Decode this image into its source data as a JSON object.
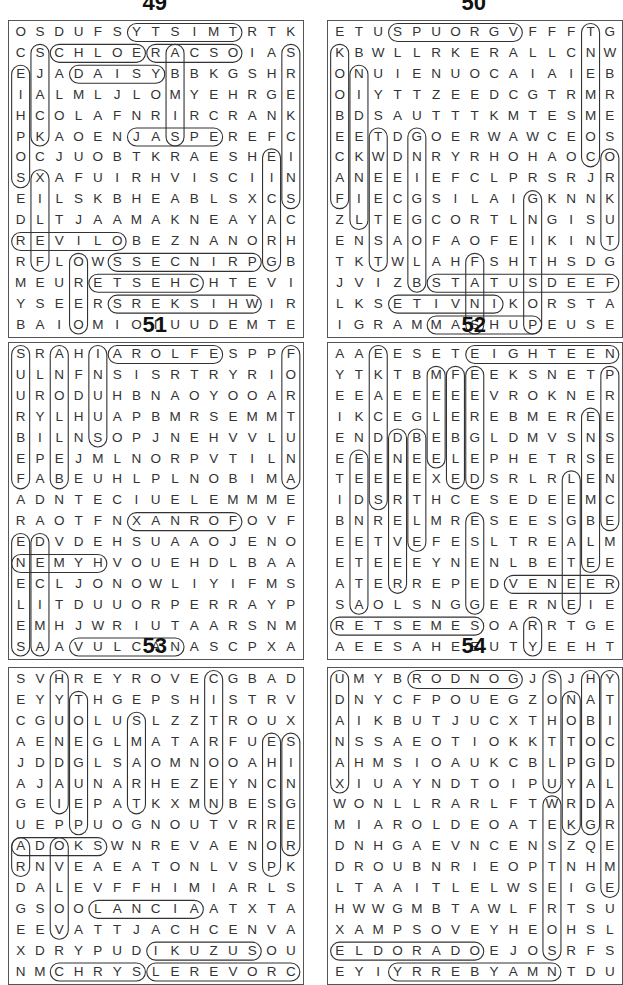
{
  "page": {
    "puzzles": [
      {
        "number": "49",
        "rows": [
          "OSDUFSYTSIMTRTK",
          "CSCHLOERACSOIAS",
          "EJADAISYBBKGSHR",
          "IALMLJLOMYEHRGE",
          "HCOLAFNRIRCRANK",
          "PKAOENJASPEREFC",
          "OCJUOBTKRAESHEI",
          "SXAFUIRHVISCIIN",
          "EILSKBHEABLSXCS",
          "DLTJAAMAKNEAYAC",
          "REVILOBEZNANORH",
          "RFLOWSSECNIRPGB",
          "MEURETSEHCHTEVI",
          "YSEERSREKSIHWIR",
          "BAIOMIOIUUDEMTE"
        ],
        "marked_words": [
          {
            "r1": 0,
            "c1": 6,
            "r2": 0,
            "c2": 11
          },
          {
            "r1": 1,
            "c1": 2,
            "r2": 1,
            "c2": 6
          },
          {
            "r1": 1,
            "c1": 7,
            "r2": 1,
            "c2": 11
          },
          {
            "r1": 2,
            "c1": 3,
            "r2": 2,
            "c2": 7
          },
          {
            "r1": 5,
            "c1": 6,
            "r2": 5,
            "c2": 10
          },
          {
            "r1": 10,
            "c1": 0,
            "r2": 10,
            "c2": 5
          },
          {
            "r1": 11,
            "c1": 5,
            "r2": 11,
            "c2": 12
          },
          {
            "r1": 12,
            "c1": 4,
            "r2": 12,
            "c2": 9
          },
          {
            "r1": 13,
            "c1": 5,
            "r2": 13,
            "c2": 12
          },
          {
            "r1": 1,
            "c1": 14,
            "r2": 8,
            "c2": 14
          },
          {
            "r1": 6,
            "c1": 13,
            "r2": 11,
            "c2": 13
          },
          {
            "r1": 1,
            "c1": 8,
            "r2": 5,
            "c2": 8
          },
          {
            "r1": 2,
            "c1": 0,
            "r2": 7,
            "c2": 0
          },
          {
            "r1": 1,
            "c1": 1,
            "r2": 5,
            "c2": 1
          },
          {
            "r1": 7,
            "c1": 1,
            "r2": 11,
            "c2": 1
          },
          {
            "r1": 11,
            "c1": 3,
            "r2": 14,
            "c2": 3
          }
        ]
      },
      {
        "number": "50",
        "rows": [
          "ETUSPUORGVFFFTG",
          "KBWLLRKERALLCNW",
          "ONUIENUOCAIAIEB",
          "OIYTTZEEDCGTRMR",
          "BDSAUTTTKMTESME",
          "EETDGOERWAWCEOS",
          "CKWDNRYRHOHAOCO",
          "ANEEIEFCLPRSRJR",
          "FIECGSILAIGKNNK",
          "ZLTEGCORTLNGISU",
          "ENSAOFAOFEIKINT",
          "TKTWLAHFSHTHSDG",
          "JVIZBSTATUSDEEF",
          "LKSETIVNIKORSTA",
          "IGRAMMASHUPEUSE"
        ],
        "marked_words": [
          {
            "r1": 0,
            "c1": 3,
            "r2": 0,
            "c2": 9
          },
          {
            "r1": 12,
            "c1": 5,
            "r2": 12,
            "c2": 14
          },
          {
            "r1": 13,
            "c1": 3,
            "r2": 13,
            "c2": 8
          },
          {
            "r1": 14,
            "c1": 5,
            "r2": 14,
            "c2": 10
          },
          {
            "r1": 1,
            "c1": 0,
            "r2": 8,
            "c2": 0
          },
          {
            "r1": 2,
            "c1": 1,
            "r2": 9,
            "c2": 1
          },
          {
            "r1": 0,
            "c1": 13,
            "r2": 6,
            "c2": 13
          },
          {
            "r1": 6,
            "c1": 14,
            "r2": 10,
            "c2": 14
          },
          {
            "r1": 5,
            "c1": 2,
            "r2": 11,
            "c2": 2
          },
          {
            "r1": 5,
            "c1": 4,
            "r2": 12,
            "c2": 4
          },
          {
            "r1": 8,
            "c1": 10,
            "r2": 14,
            "c2": 10
          },
          {
            "r1": 11,
            "c1": 7,
            "r2": 14,
            "c2": 7
          }
        ]
      },
      {
        "number": "51",
        "rows": [
          "SRAHIAROLFESPPF",
          "ULNFNSISRTRYRIO",
          "URODUHBNAOYOOAR",
          "RYLHUAPBMRSEMMT",
          "BILNSOPJNEHVVLU",
          "EPEJMLNORPVTILN",
          "FABEUHLPLNOBIMA",
          "ADNTECIUELEMMME",
          "RAOTFNXANROFOVF",
          "EDVDEHSUAAOJENO",
          "NEMYHVOUEHDLBAA",
          "ECLJONOWLIYIFMS",
          "LITDUUORPERRAYP",
          "EMHJWRIUTAARSNM",
          "SAAVULCANASCPXA"
        ],
        "marked_words": [
          {
            "r1": 0,
            "c1": 5,
            "r2": 0,
            "c2": 10
          },
          {
            "r1": 8,
            "c1": 6,
            "r2": 8,
            "c2": 11
          },
          {
            "r1": 10,
            "c1": 0,
            "r2": 10,
            "c2": 4
          },
          {
            "r1": 14,
            "c1": 3,
            "r2": 14,
            "c2": 8
          },
          {
            "r1": 0,
            "c1": 0,
            "r2": 6,
            "c2": 0
          },
          {
            "r1": 0,
            "c1": 2,
            "r2": 6,
            "c2": 2
          },
          {
            "r1": 0,
            "c1": 4,
            "r2": 4,
            "c2": 4
          },
          {
            "r1": 0,
            "c1": 14,
            "r2": 6,
            "c2": 14
          },
          {
            "r1": 9,
            "c1": 0,
            "r2": 14,
            "c2": 0
          },
          {
            "r1": 9,
            "c1": 1,
            "r2": 14,
            "c2": 1
          }
        ]
      },
      {
        "number": "52",
        "rows": [
          "AAEESETEIGHTEEN",
          "YTKTBMFEEKSNETP",
          "EEAEEEEEVROKNER",
          "IKCEGLEREBMEREE",
          "ENDDBEBGLDMVSNS",
          "EEENEELEPHETRSE",
          "TEEEEXEDSRLRLEN",
          "IDSRTHCESEDEEMC",
          "BNRELMRESEESGBE",
          "EETVEFESLTREALM",
          "ETEEEYNENLBETEE",
          "ATERREPEDVENEER",
          "SAOLSNGGEERNEIE",
          "RETSEMESOARRTGE",
          "AEESAHEEUTYEEHT"
        ],
        "marked_words": [
          {
            "r1": 0,
            "c1": 7,
            "r2": 0,
            "c2": 14
          },
          {
            "r1": 11,
            "c1": 9,
            "r2": 11,
            "c2": 14
          },
          {
            "r1": 13,
            "c1": 0,
            "r2": 13,
            "c2": 7
          },
          {
            "r1": 0,
            "c1": 2,
            "r2": 7,
            "c2": 2
          },
          {
            "r1": 1,
            "c1": 5,
            "r2": 5,
            "c2": 5
          },
          {
            "r1": 1,
            "c1": 6,
            "r2": 6,
            "c2": 6
          },
          {
            "r1": 1,
            "c1": 7,
            "r2": 6,
            "c2": 7
          },
          {
            "r1": 1,
            "c1": 14,
            "r2": 8,
            "c2": 14
          },
          {
            "r1": 5,
            "c1": 1,
            "r2": 12,
            "c2": 1
          },
          {
            "r1": 4,
            "c1": 3,
            "r2": 11,
            "c2": 3
          },
          {
            "r1": 4,
            "c1": 4,
            "r2": 9,
            "c2": 4
          },
          {
            "r1": 6,
            "c1": 12,
            "r2": 12,
            "c2": 12
          },
          {
            "r1": 3,
            "c1": 13,
            "r2": 10,
            "c2": 13
          },
          {
            "r1": 8,
            "c1": 7,
            "r2": 12,
            "c2": 7
          },
          {
            "r1": 13,
            "c1": 10,
            "r2": 14,
            "c2": 10
          }
        ]
      },
      {
        "number": "53",
        "rows": [
          "SVHREYROVECGBAD",
          "EYYTHGEPSHISTRV",
          "CGUOLUSLZZTROUX",
          "AENEGLMATARFUES",
          "JDDGLSAOMNOOAHI",
          "AJAUNARHEZEYNCN",
          "GEIEPATKXMNBESG",
          "UEPPUOGNOUTVRRE",
          "ADOKSWNREVAENOR",
          "RNVEAEATONLVSPK",
          "DALEVFFHIMIARLS",
          "GSOOLANCIAATXTA",
          "EEVATTJACHCENVA",
          "XDRYPUDIKUZUSOU",
          "NMCHRYSLEREVORC"
        ],
        "marked_words": [
          {
            "r1": 8,
            "c1": 0,
            "r2": 8,
            "c2": 4
          },
          {
            "r1": 11,
            "c1": 4,
            "r2": 11,
            "c2": 9
          },
          {
            "r1": 13,
            "c1": 7,
            "r2": 13,
            "c2": 12
          },
          {
            "r1": 14,
            "c1": 2,
            "r2": 14,
            "c2": 6
          },
          {
            "r1": 14,
            "c1": 7,
            "r2": 14,
            "c2": 14
          },
          {
            "r1": 0,
            "c1": 2,
            "r2": 6,
            "c2": 2
          },
          {
            "r1": 1,
            "c1": 3,
            "r2": 7,
            "c2": 3
          },
          {
            "r1": 0,
            "c1": 10,
            "r2": 6,
            "c2": 10
          },
          {
            "r1": 3,
            "c1": 13,
            "r2": 9,
            "c2": 13
          },
          {
            "r1": 3,
            "c1": 14,
            "r2": 8,
            "c2": 14
          },
          {
            "r1": 8,
            "c1": 0,
            "r2": 9,
            "c2": 0
          },
          {
            "r1": 8,
            "c1": 2,
            "r2": 12,
            "c2": 2
          },
          {
            "r1": 2,
            "c1": 6,
            "r2": 6,
            "c2": 6
          }
        ]
      },
      {
        "number": "54",
        "rows": [
          "UMYBRODNOGJSJHY",
          "DNYCFPOUEGZONAT",
          "AIKBUTJUCXTHOBI",
          "NSSAEOTIOKKTTOC",
          "AHMSIOAUKCBLPGD",
          "XIUAYNDTOIPUYAL",
          "WONLLRARLFTWRDA",
          "MIAROLDEOATEKGR",
          "DNHGAEVNCENSZQE",
          "DROUBNRIEOPTNHM",
          "LTAAITLELWSEIGE",
          "HWWGMBTAWLFRTSU",
          "XAMPSOVEYHEOHSL",
          "ELDORADOEJOSRFS",
          "EYIYRREBYAMNTDU"
        ],
        "marked_words": [
          {
            "r1": 0,
            "c1": 4,
            "r2": 0,
            "c2": 9
          },
          {
            "r1": 13,
            "c1": 0,
            "r2": 13,
            "c2": 7
          },
          {
            "r1": 14,
            "c1": 3,
            "r2": 14,
            "c2": 11
          },
          {
            "r1": 0,
            "c1": 0,
            "r2": 5,
            "c2": 0
          },
          {
            "r1": 0,
            "c1": 11,
            "r2": 5,
            "c2": 11
          },
          {
            "r1": 1,
            "c1": 12,
            "r2": 7,
            "c2": 12
          },
          {
            "r1": 0,
            "c1": 13,
            "r2": 7,
            "c2": 13
          },
          {
            "r1": 0,
            "c1": 14,
            "r2": 10,
            "c2": 14
          },
          {
            "r1": 6,
            "c1": 11,
            "r2": 13,
            "c2": 11
          }
        ]
      }
    ]
  }
}
